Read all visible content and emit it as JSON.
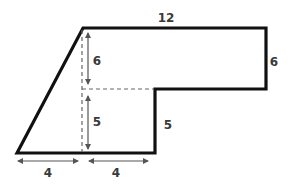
{
  "diagram": {
    "type": "composite-shape",
    "colors": {
      "outline": "#111111",
      "dashed": "#666666",
      "arrow": "#555555",
      "label": "#3a3a3a"
    },
    "labels": {
      "top": "12",
      "right": "6",
      "inner_step": "5",
      "upper_height": "6",
      "lower_height": "5",
      "bottom_left": "4",
      "bottom_right": "4"
    }
  }
}
